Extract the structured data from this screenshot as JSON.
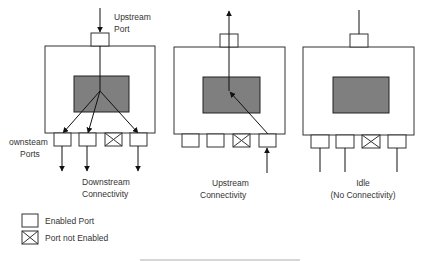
{
  "colors": {
    "line": "#222222",
    "chip_fill": "#7f7f7f",
    "box_fill": "#ffffff",
    "text": "#333333"
  },
  "diagrams": [
    {
      "id": "downstream",
      "top_label_line1": "Upstream",
      "top_label_line2": "Port",
      "side_label_line1": "ownsteam",
      "side_label_line2": "Ports",
      "bottom_label_line1": "Downstream",
      "bottom_label_line2": "Connectivity",
      "ports": [
        "enabled",
        "enabled",
        "disabled",
        "enabled"
      ]
    },
    {
      "id": "upstream",
      "bottom_label_line1": "Upstream",
      "bottom_label_line2": "Connectivity",
      "ports": [
        "enabled",
        "enabled",
        "disabled",
        "enabled"
      ]
    },
    {
      "id": "idle",
      "bottom_label_line1": "Idle",
      "bottom_label_line2": "(No Connectivity)",
      "ports": [
        "enabled",
        "enabled",
        "disabled",
        "enabled"
      ]
    }
  ],
  "legend": {
    "enabled_label": "Enabled Port",
    "disabled_label": "Port not Enabled"
  }
}
